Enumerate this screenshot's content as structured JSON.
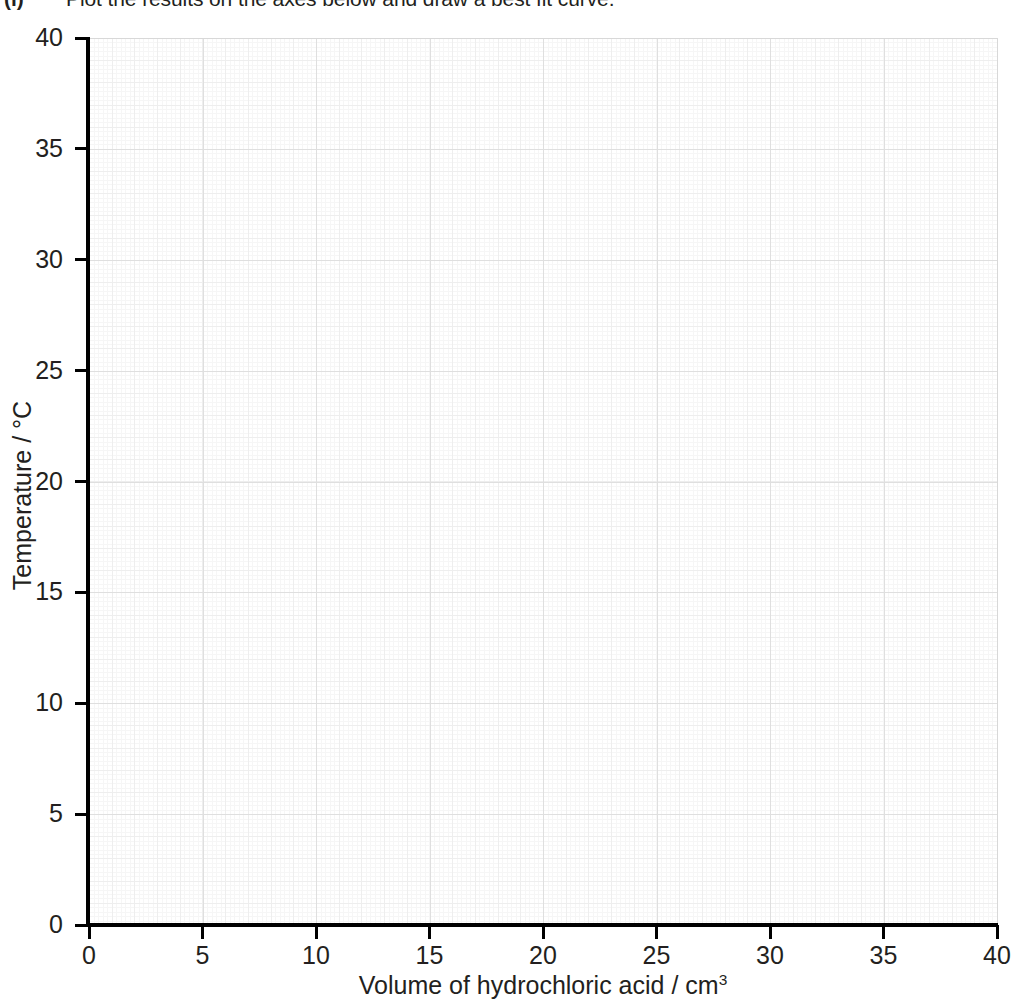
{
  "question": {
    "label": "(i)",
    "text": "Plot the results on the axes below and draw a best fit curve."
  },
  "chart_data": {
    "type": "scatter",
    "title": "",
    "xlabel_prefix": "Volume of hydrochloric acid / cm",
    "xlabel_superscript": "3",
    "xlabel": "Volume of hydrochloric acid / cm3",
    "ylabel_prefix": "Temperature / ",
    "ylabel_unit": "°C",
    "ylabel": "Temperature / °C",
    "xlim": [
      0,
      40
    ],
    "ylim": [
      0,
      40
    ],
    "x_ticks": [
      0,
      5,
      10,
      15,
      20,
      25,
      30,
      35,
      40
    ],
    "y_ticks": [
      0,
      5,
      10,
      15,
      20,
      25,
      30,
      35,
      40
    ],
    "x_tick_labels": [
      "0",
      "5",
      "10",
      "15",
      "20",
      "25",
      "30",
      "35",
      "40"
    ],
    "y_tick_labels": [
      "0",
      "5",
      "10",
      "15",
      "20",
      "25",
      "30",
      "35",
      "40"
    ],
    "x_major_step": 5,
    "y_major_step": 5,
    "grid": true,
    "grid_style": "graph-paper",
    "legend": false,
    "series": [],
    "values": [],
    "annotations": [],
    "note": "Blank graph-paper axes provided for the student to plot data on; no data points are drawn."
  },
  "colors": {
    "axis": "#000000",
    "text": "#231f20",
    "grid_major": "#dfdfdf",
    "grid_medium": "#eeeeee",
    "grid_fine": "#f6f6f6",
    "plot_border": "#d8d8d8",
    "background": "#ffffff"
  }
}
